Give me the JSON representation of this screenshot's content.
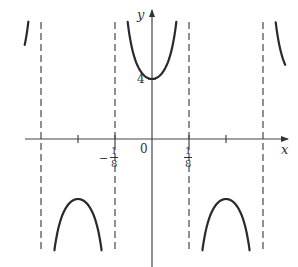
{
  "chart_data": {
    "type": "line",
    "title": "",
    "function": "y = 4 sec(4πx)",
    "xlabel": "x",
    "ylabel": "y",
    "x_tick_labels": [
      {
        "value": -0.125,
        "label_sign": "−",
        "label_num": "1",
        "label_den": "8"
      },
      {
        "value": 0,
        "label": "0"
      },
      {
        "value": 0.125,
        "label_num": "1",
        "label_den": "8"
      }
    ],
    "x_unlabeled_ticks": [
      -0.25,
      0.25
    ],
    "y_tick_labels": [
      {
        "value": 4,
        "label": "4"
      }
    ],
    "asymptotes": [
      -0.375,
      -0.125,
      0.125,
      0.375
    ],
    "asymptote_style": "dashed",
    "branches": [
      {
        "name": "left-outer-down",
        "x_range": [
          -0.42,
          -0.375
        ],
        "direction": "down"
      },
      {
        "name": "upper-left",
        "x_range": [
          -0.375,
          -0.125
        ],
        "min_point": [
          -0.25,
          4
        ]
      },
      {
        "name": "center-down",
        "x_range": [
          -0.125,
          0.125
        ],
        "max_point": [
          0,
          -4
        ]
      },
      {
        "name": "upper-right",
        "x_range": [
          0.125,
          0.375
        ],
        "min_point": [
          0.25,
          4
        ]
      },
      {
        "name": "right-outer-down",
        "x_range": [
          0.375,
          0.42
        ],
        "direction": "down"
      }
    ],
    "xlim": [
      -0.43,
      0.45
    ],
    "ylim": [
      -8.6,
      8.5
    ],
    "grid": false,
    "legend": null
  },
  "labels": {
    "y_axis": "y",
    "x_axis": "x",
    "origin": "0",
    "y_tick_4": "4",
    "neg_sign": "−",
    "frac_num": "1",
    "frac_den": "8"
  },
  "colors": {
    "curve": "#2a2a2a",
    "axes": "#444444",
    "asymptote": "#555555"
  }
}
